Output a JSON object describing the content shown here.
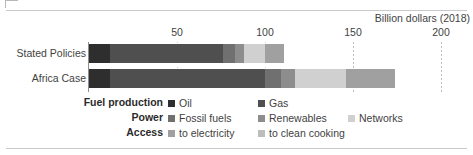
{
  "chart_data": {
    "type": "bar",
    "orientation": "horizontal",
    "stacked": true,
    "title": "",
    "axis_title": "Billion dollars (2018)",
    "xlabel": "Billion dollars (2018)",
    "ylabel": "",
    "xlim": [
      0,
      200
    ],
    "grid": true,
    "ticks": [
      {
        "label": "50",
        "value": 50
      },
      {
        "label": "100",
        "value": 100
      },
      {
        "label": "150",
        "value": 150
      },
      {
        "label": "200",
        "value": 200
      }
    ],
    "categories": [
      "Stated Policies",
      "Africa Case"
    ],
    "legend_position": "bottom",
    "series": [
      {
        "name": "Oil",
        "group": "Fuel production",
        "color": "#2e2e2e",
        "values": [
          12,
          12
        ]
      },
      {
        "name": "Gas",
        "group": "Fuel production",
        "color": "#4f4f4f",
        "values": [
          64,
          88
        ]
      },
      {
        "name": "Fossil fuels",
        "group": "Power",
        "color": "#707070",
        "values": [
          7,
          9
        ]
      },
      {
        "name": "Renewables",
        "group": "Power",
        "color": "#8d8d8d",
        "values": [
          5,
          8
        ]
      },
      {
        "name": "Networks",
        "group": "Power",
        "color": "#d0d0d0",
        "values": [
          12,
          29
        ]
      },
      {
        "name": "to electricity",
        "group": "Access",
        "color": "#a0a0a0",
        "values": [
          11,
          28
        ]
      },
      {
        "name": "to clean cooking",
        "group": "Access",
        "color": "#bdbdbd",
        "values": [
          0,
          0
        ]
      }
    ],
    "totals": [
      111,
      174
    ]
  },
  "legend": {
    "groups": [
      {
        "label": "Fuel production",
        "items": [
          {
            "label": "Oil",
            "color": "#2e2e2e"
          },
          {
            "label": "Gas",
            "color": "#4f4f4f"
          }
        ]
      },
      {
        "label": "Power",
        "items": [
          {
            "label": "Fossil fuels",
            "color": "#707070"
          },
          {
            "label": "Renewables",
            "color": "#8d8d8d"
          },
          {
            "label": "Networks",
            "color": "#d0d0d0"
          }
        ]
      },
      {
        "label": "Access",
        "items": [
          {
            "label": "to electricity",
            "color": "#a0a0a0"
          },
          {
            "label": "to clean cooking",
            "color": "#bdbdbd"
          }
        ]
      }
    ]
  }
}
